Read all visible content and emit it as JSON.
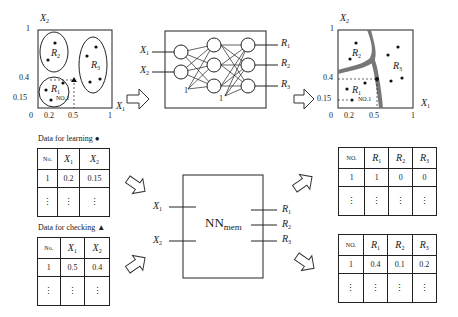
{
  "plot_learning": {
    "x_axis_label": "X",
    "x_axis_sub": "1",
    "y_axis_label": "X",
    "y_axis_sub": "2",
    "x_ticks": [
      "0",
      "0.2",
      "0.5",
      "1"
    ],
    "y_ticks": [
      "1",
      "0.4",
      "0.15"
    ],
    "regions": [
      {
        "label": "R",
        "sub": "1"
      },
      {
        "label": "R",
        "sub": "2"
      },
      {
        "label": "R",
        "sub": "3"
      }
    ],
    "point_label": "NO.1"
  },
  "network": {
    "inputs": [
      {
        "label": "X",
        "sub": "1"
      },
      {
        "label": "X",
        "sub": "2"
      }
    ],
    "outputs": [
      {
        "label": "R",
        "sub": "1"
      },
      {
        "label": "R",
        "sub": "2"
      },
      {
        "label": "R",
        "sub": "3"
      }
    ],
    "bias_labels": [
      "1",
      "1"
    ]
  },
  "plot_result": {
    "x_axis_label": "X",
    "x_axis_sub": "1",
    "y_axis_label": "X",
    "y_axis_sub": "2",
    "x_ticks": [
      "0",
      "0.2",
      "0.5",
      "1"
    ],
    "y_ticks": [
      "1",
      "0.4",
      "0.15"
    ],
    "regions": [
      {
        "label": "R",
        "sub": "1"
      },
      {
        "label": "R",
        "sub": "2"
      },
      {
        "label": "R",
        "sub": "3"
      }
    ],
    "point_label": "NO.1"
  },
  "learning_table": {
    "caption": "Data for learning",
    "marker": "●",
    "headers": [
      "No.",
      "X1",
      "X2"
    ],
    "rows": [
      [
        "1",
        "0.2",
        "0.15"
      ]
    ],
    "dots": "⋮"
  },
  "checking_table": {
    "caption": "Data for checking",
    "marker": "▲",
    "headers": [
      "No.",
      "X1",
      "X2"
    ],
    "rows": [
      [
        "1",
        "0.5",
        "0.4"
      ]
    ],
    "dots": "⋮"
  },
  "nn_mem": {
    "label": "NN",
    "sub": "mem",
    "inputs": [
      {
        "label": "X",
        "sub": "1"
      },
      {
        "label": "X",
        "sub": "2"
      }
    ],
    "outputs": [
      {
        "label": "R",
        "sub": "1"
      },
      {
        "label": "R",
        "sub": "2"
      },
      {
        "label": "R",
        "sub": "3"
      }
    ]
  },
  "learning_output_table": {
    "headers": [
      "NO.",
      "R1",
      "R2",
      "R3"
    ],
    "rows": [
      [
        "1",
        "1",
        "0",
        "0"
      ]
    ],
    "dots": "⋮"
  },
  "checking_output_table": {
    "headers": [
      "NO.",
      "R1",
      "R2",
      "R3"
    ],
    "rows": [
      [
        "1",
        "0.4",
        "0.1",
        "0.2"
      ]
    ],
    "dots": "⋮"
  }
}
